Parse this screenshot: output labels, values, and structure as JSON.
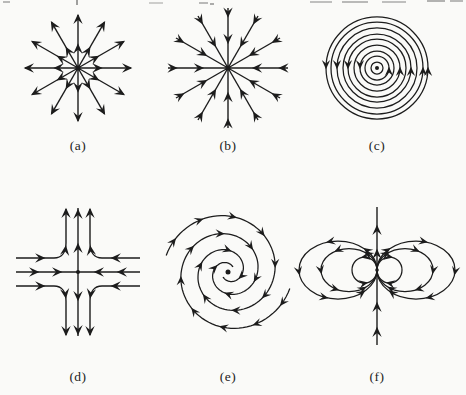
{
  "figure": {
    "panels": [
      {
        "label": "(a)",
        "name": "source"
      },
      {
        "label": "(b)",
        "name": "sink"
      },
      {
        "label": "(c)",
        "name": "center-circles"
      },
      {
        "label": "(d)",
        "name": "saddle"
      },
      {
        "label": "(e)",
        "name": "spiral"
      },
      {
        "label": "(f)",
        "name": "dipole"
      }
    ],
    "colors": {
      "ink": "#1c1c1c",
      "paper": "#fafaf8",
      "artifact": "#777777"
    }
  }
}
